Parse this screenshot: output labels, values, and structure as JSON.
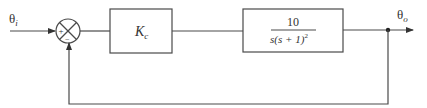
{
  "diagram": {
    "type": "closed-loop-block-diagram",
    "input": {
      "symbol": "θ",
      "subscript": "i"
    },
    "output": {
      "symbol": "θ",
      "subscript": "o"
    },
    "summing_junction": {
      "plus_sign": "+",
      "minus_sign": "−"
    },
    "blocks": [
      {
        "id": "controller",
        "label_main": "K",
        "label_sub": "c"
      },
      {
        "id": "plant",
        "numerator": "10",
        "denominator_main": "s(s + 1)",
        "denominator_exp": "2"
      }
    ],
    "feedback": "unity negative feedback",
    "colors": {
      "stroke": "#4a4a4a",
      "text": "#333333",
      "background": "#ffffff"
    }
  }
}
